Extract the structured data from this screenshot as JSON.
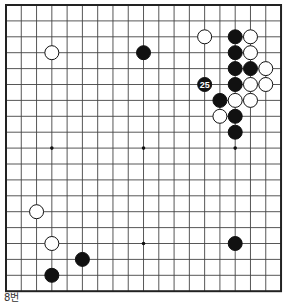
{
  "board": {
    "size": 19,
    "origin_x": 6,
    "origin_y": 5,
    "spacing_x": 15.28,
    "spacing_y": 15.9,
    "line_color": "#444444",
    "edge_color": "#222222",
    "background": "#ffffff",
    "star_points": [
      [
        3,
        9
      ],
      [
        9,
        9
      ],
      [
        15,
        9
      ],
      [
        3,
        15
      ],
      [
        9,
        15
      ],
      [
        15,
        15
      ]
    ],
    "stones": [
      {
        "color": "white",
        "col": 3,
        "row": 3
      },
      {
        "color": "black",
        "col": 9,
        "row": 3
      },
      {
        "color": "white",
        "col": 13,
        "row": 2
      },
      {
        "color": "black",
        "col": 15,
        "row": 2
      },
      {
        "color": "black",
        "col": 15,
        "row": 3
      },
      {
        "color": "black",
        "col": 15,
        "row": 4
      },
      {
        "color": "black",
        "col": 15,
        "row": 5
      },
      {
        "color": "white",
        "col": 16,
        "row": 2
      },
      {
        "color": "white",
        "col": 16,
        "row": 3
      },
      {
        "color": "black",
        "col": 16,
        "row": 4
      },
      {
        "color": "white",
        "col": 16,
        "row": 5
      },
      {
        "color": "white",
        "col": 17,
        "row": 4
      },
      {
        "color": "white",
        "col": 17,
        "row": 5
      },
      {
        "color": "black",
        "col": 13,
        "row": 5,
        "label": "25"
      },
      {
        "color": "black",
        "col": 14,
        "row": 6
      },
      {
        "color": "white",
        "col": 15,
        "row": 6
      },
      {
        "color": "white",
        "col": 16,
        "row": 6
      },
      {
        "color": "white",
        "col": 14,
        "row": 7
      },
      {
        "color": "black",
        "col": 15,
        "row": 7
      },
      {
        "color": "black",
        "col": 15,
        "row": 8
      },
      {
        "color": "white",
        "col": 2,
        "row": 13
      },
      {
        "color": "white",
        "col": 3,
        "row": 15
      },
      {
        "color": "black",
        "col": 15,
        "row": 15
      },
      {
        "color": "black",
        "col": 5,
        "row": 16
      },
      {
        "color": "black",
        "col": 3,
        "row": 17
      }
    ]
  },
  "caption": "8번"
}
